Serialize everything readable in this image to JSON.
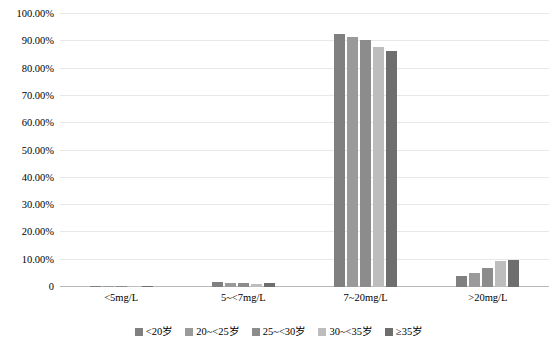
{
  "chart_data": {
    "type": "bar",
    "title": "",
    "subtitle": "",
    "xlabel": "",
    "ylabel": "",
    "categories": [
      "<5mg/L",
      "5~<7mg/L",
      "7~20mg/L",
      ">20mg/L"
    ],
    "series": [
      {
        "name": "<20岁",
        "color": "#808080",
        "values": [
          0.15,
          1.8,
          92.8,
          4.2
        ]
      },
      {
        "name": "20~<25岁",
        "color": "#9a9a9a",
        "values": [
          0.15,
          1.55,
          91.7,
          5.3
        ]
      },
      {
        "name": "25~<30岁",
        "color": "#8c8c8c",
        "values": [
          0.2,
          1.55,
          90.3,
          7.0
        ]
      },
      {
        "name": "30~<35岁",
        "color": "#bdbdbd",
        "values": [
          0.15,
          1.0,
          88.0,
          9.6
        ]
      },
      {
        "name": "≥35岁",
        "color": "#6e6e6e",
        "values": [
          0.25,
          1.35,
          86.6,
          9.9
        ]
      }
    ],
    "ylim": [
      0,
      100
    ],
    "y_ticks": [
      0,
      10,
      20,
      30,
      40,
      50,
      60,
      70,
      80,
      90,
      100
    ],
    "y_tick_labels": [
      "0",
      "10.00%",
      "20.00%",
      "30.00%",
      "40.00%",
      "50.00%",
      "60.00%",
      "70.00%",
      "80.00%",
      "90.00%",
      "100.00%"
    ],
    "grid": true,
    "grid_color": "#e8e8e8",
    "axis_color": "#b8b8b8",
    "legend_position": "bottom",
    "background": "#ffffff"
  }
}
